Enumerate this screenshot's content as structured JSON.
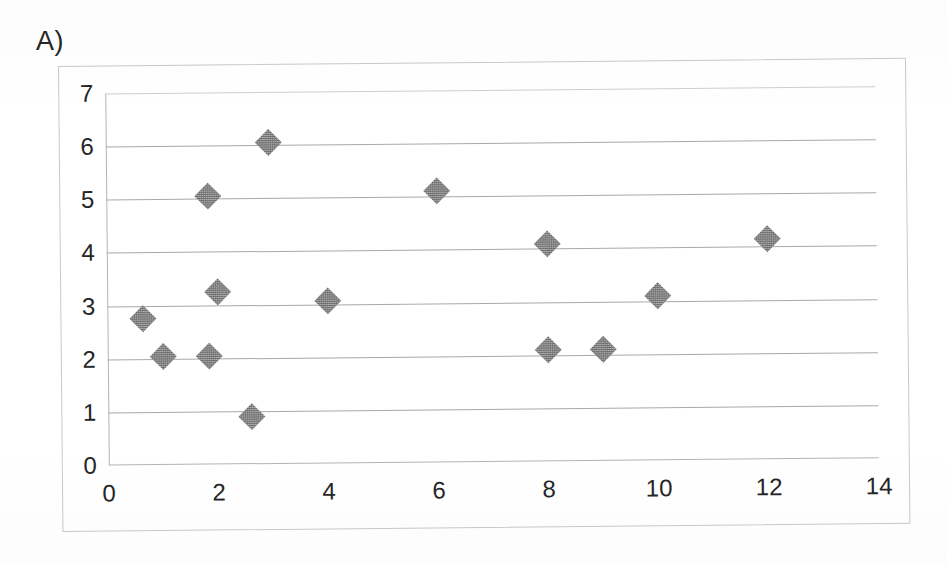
{
  "figure": {
    "panel_label": "A)",
    "background_color": "#ffffff",
    "frame_color": "#c9c9c9"
  },
  "chart_data": {
    "type": "scatter",
    "title": "",
    "subtitle": "",
    "xlabel": "",
    "ylabel": "",
    "xlim": [
      0,
      14
    ],
    "ylim": [
      0,
      7
    ],
    "xticks": [
      0,
      2,
      4,
      6,
      8,
      10,
      12,
      14
    ],
    "yticks": [
      0,
      1,
      2,
      3,
      4,
      5,
      6,
      7
    ],
    "xtick_labels": [
      "0",
      "2",
      "4",
      "6",
      "8",
      "10",
      "12",
      "14"
    ],
    "ytick_labels": [
      "0",
      "1",
      "2",
      "3",
      "4",
      "5",
      "6",
      "7"
    ],
    "grid": "horizontal",
    "legend": null,
    "legend_position": "none",
    "marker": "diamond",
    "marker_color": "#6e6e6e",
    "marker_size_px": 19,
    "gridline_color": "#a9a9a9",
    "axis_color": "#b4b4b4",
    "series": [
      {
        "name": "series-1",
        "points": [
          {
            "x": 0.65,
            "y": 2.75
          },
          {
            "x": 1.0,
            "y": 2.05
          },
          {
            "x": 1.85,
            "y": 5.05
          },
          {
            "x": 1.85,
            "y": 2.05
          },
          {
            "x": 2.0,
            "y": 3.25
          },
          {
            "x": 2.6,
            "y": 0.9
          },
          {
            "x": 2.95,
            "y": 6.05
          },
          {
            "x": 4.0,
            "y": 3.05
          },
          {
            "x": 6.0,
            "y": 5.1
          },
          {
            "x": 8.0,
            "y": 4.1
          },
          {
            "x": 8.0,
            "y": 2.1
          },
          {
            "x": 9.0,
            "y": 2.1
          },
          {
            "x": 10.0,
            "y": 3.1
          },
          {
            "x": 12.0,
            "y": 4.15
          }
        ]
      }
    ]
  }
}
